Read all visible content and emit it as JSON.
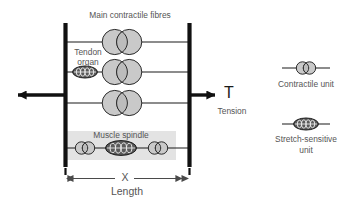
{
  "figure": {
    "title_absent": true,
    "background_color": "#ffffff",
    "labels": {
      "main_fibres": "Main contractile fibres",
      "tendon_organ_line1": "Tendon",
      "tendon_organ_line2": "organ",
      "muscle_spindle": "Muscle spindle",
      "tension_symbol": "T",
      "tension_word": "Tension",
      "length_symbol": "X",
      "length_word": "Length"
    },
    "legend": {
      "items": [
        {
          "name": "contractile-unit",
          "label": "Contractile unit",
          "icon": "lens-double-circle",
          "fill": "#c9c9c9"
        },
        {
          "name": "stretch-sensitive-unit",
          "label_line1": "Stretch-sensitive",
          "label_line2": "unit",
          "icon": "dark-coil-ellipse",
          "fill": "#5b5b5b"
        }
      ]
    },
    "elements": {
      "anchor_bars": 2,
      "fiber_rows": 4,
      "contractile_units_main": 3,
      "tendon_organs": 1,
      "spindle_contractile_units": 2,
      "spindle_stretch_units": 1,
      "arrows": [
        "tension-left",
        "tension-right",
        "length-dimension"
      ]
    },
    "colors": {
      "line": "#1a1a1a",
      "bar": "#111111",
      "contractile_fill": "#c9c9c9",
      "stretch_fill": "#5b5b5b",
      "spindle_backdrop": "#e3e3e3",
      "text": "#555555"
    }
  }
}
